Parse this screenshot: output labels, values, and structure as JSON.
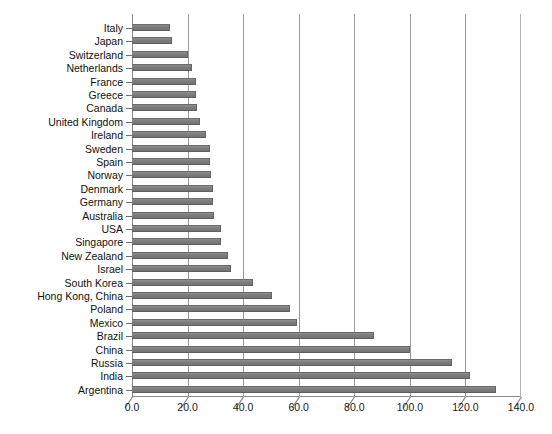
{
  "chart_data": {
    "type": "bar",
    "orientation": "horizontal",
    "title": "",
    "subtitle": "",
    "xlabel": "",
    "ylabel": "",
    "xlim": [
      0.0,
      140.0
    ],
    "xticks": [
      "0.0",
      "20.0",
      "40.0",
      "60.0",
      "80.0",
      "100.0",
      "120.0",
      "140.0"
    ],
    "xtick_values": [
      0,
      20,
      40,
      60,
      80,
      100,
      120,
      140
    ],
    "grid": "vertical",
    "legend": "none",
    "bar_color": "#808080",
    "axis_color": "#8a8a8a",
    "background": "#ffffff",
    "categories": [
      "Italy",
      "Japan",
      "Switzerland",
      "Netherlands",
      "France",
      "Greece",
      "Canada",
      "United Kingdom",
      "Ireland",
      "Sweden",
      "Spain",
      "Norway",
      "Denmark",
      "Germany",
      "Australia",
      "USA",
      "Singapore",
      "New Zealand",
      "Israel",
      "South Korea",
      "Hong Kong, China",
      "Poland",
      "Mexico",
      "Brazil",
      "China",
      "Russia",
      "India",
      "Argentina"
    ],
    "values": [
      13.5,
      14.5,
      20.0,
      21.5,
      23.0,
      23.0,
      23.5,
      24.5,
      26.5,
      28.0,
      28.0,
      28.5,
      29.0,
      29.0,
      29.5,
      32.0,
      32.0,
      34.5,
      35.5,
      43.5,
      50.5,
      57.0,
      59.5,
      87.0,
      100.0,
      115.0,
      121.5,
      131.0
    ]
  }
}
